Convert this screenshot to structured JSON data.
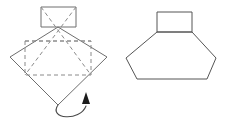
{
  "diagram": {
    "type": "origami-fold-step",
    "line_colors": {
      "solid_edge": "#6e6e6e",
      "solid_edge_dark": "#555555",
      "fold_dashed": "#8a8a8a",
      "arrow": "#4a4a4a",
      "arrow_head": "#1c1c1c",
      "background": "#ffffff"
    },
    "figures": [
      {
        "id": "before",
        "label": "square-with-fold-lines",
        "shapes": {
          "top_rectangle": {
            "name": "top-tab-rectangle",
            "points": "41,7 76,7 76,27 41,27"
          },
          "diamond": {
            "name": "square-rotated-diamond",
            "points": "58,27 107,57 58,105 10,57"
          },
          "inner_dashed_square": {
            "name": "inner-fold-square",
            "points": "25,41 91,41 91,75 25,75"
          },
          "fold_diagonals": [
            {
              "name": "fold-diagonal-left",
              "points": "41,7 91,75"
            },
            {
              "name": "fold-diagonal-right",
              "points": "76,7 25,75"
            },
            {
              "name": "fold-horizontal",
              "points": "25,41 91,41"
            }
          ],
          "arrow": {
            "name": "fold-direction-arrow",
            "path": "M 58,105 C 48,119 80,122 86,106",
            "head": "86,92 90,104 82,104"
          }
        }
      },
      {
        "id": "after",
        "label": "folded-hexagon-result",
        "shapes": {
          "top_rectangle": {
            "name": "result-top-tab-rectangle",
            "points": "157,12 192,12 192,32 157,32"
          },
          "hexagon": {
            "name": "result-hexagon-body",
            "points": "157,32 192,32 216,58 207,79 137,79 126,58"
          }
        }
      }
    ]
  }
}
